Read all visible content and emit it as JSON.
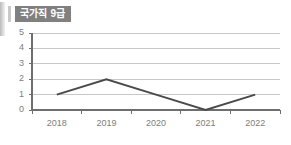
{
  "badge": {
    "label": "국가직 9급"
  },
  "chart_data": {
    "type": "line",
    "title": "국가직 9급",
    "xlabel": "",
    "ylabel": "",
    "categories": [
      "2018",
      "2019",
      "2020",
      "2021",
      "2022"
    ],
    "values": [
      1,
      2,
      1,
      0,
      1
    ],
    "series": [
      {
        "name": "국가직 9급",
        "values": [
          1,
          2,
          1,
          0,
          1
        ]
      }
    ],
    "ylim": [
      0,
      5
    ],
    "yticks": [
      "0",
      "1",
      "2",
      "3",
      "4",
      "5"
    ],
    "grid": true,
    "legend": false,
    "line_color": "#4a4a4a",
    "grid_color": "#c8c8c8",
    "axis_color": "#6e6e6e",
    "tick_label_color": "#7d7d7d",
    "background": "#ffffff",
    "badge_background": "#808080",
    "badge_text_color": "#ffffff",
    "markers": false
  }
}
